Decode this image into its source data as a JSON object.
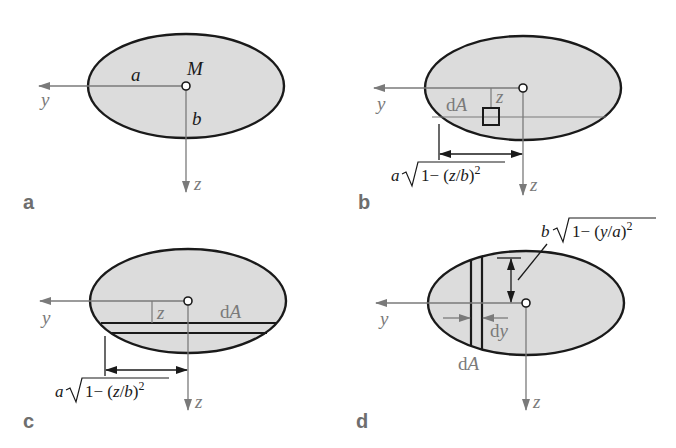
{
  "figure": {
    "colors": {
      "fill": "#dcdcdc",
      "outline": "#1a1a1a",
      "axis": "#7a7a7a",
      "background": "#ffffff"
    },
    "panels": [
      {
        "id": "a",
        "label": "a",
        "axis_y": "y",
        "axis_z": "z",
        "centroid": "M",
        "semi_axis_horizontal": "a",
        "semi_axis_vertical": "b"
      },
      {
        "id": "b",
        "label": "b",
        "axis_y": "y",
        "axis_z": "z",
        "element": "dA",
        "element_offset": "z",
        "formula": {
          "coef": "a",
          "radicand_pre": "1− (",
          "var": "z",
          "slash": "/",
          "den": "b",
          "post": ")",
          "exp": "2"
        }
      },
      {
        "id": "c",
        "label": "c",
        "axis_y": "y",
        "axis_z": "z",
        "element": "dA",
        "element_offset": "z",
        "formula": {
          "coef": "a",
          "radicand_pre": "1− (",
          "var": "z",
          "slash": "/",
          "den": "b",
          "post": ")",
          "exp": "2"
        }
      },
      {
        "id": "d",
        "label": "d",
        "axis_y": "y",
        "axis_z": "z",
        "element": "dA",
        "strip_width": "dy",
        "formula": {
          "coef": "b",
          "radicand_pre": "1− (",
          "var": "y",
          "slash": "/",
          "den": "a",
          "post": ")",
          "exp": "2"
        }
      }
    ],
    "text": {
      "d_roman": "d",
      "A_italic": "A",
      "y_italic": "y"
    }
  }
}
